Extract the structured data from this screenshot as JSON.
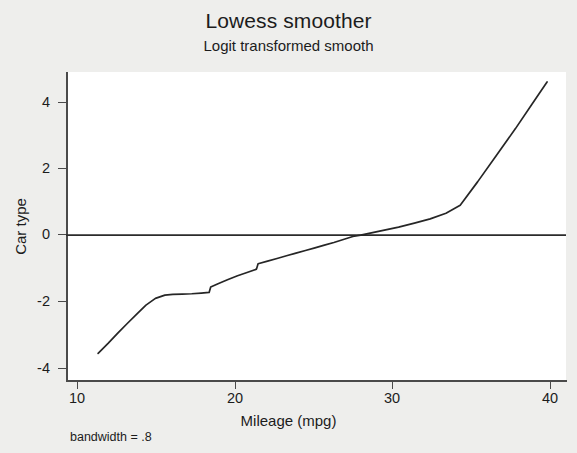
{
  "chart_data": {
    "type": "line",
    "title": "Lowess smoother",
    "subtitle": "Logit transformed smooth",
    "xlabel": "Mileage (mpg)",
    "ylabel": "Car type",
    "note": "bandwidth = .8",
    "grid": false,
    "legend": "none",
    "xlim": [
      10.0,
      41.6
    ],
    "ylim": [
      -4.35,
      4.9
    ],
    "xticks": [
      10,
      20,
      30,
      40
    ],
    "xtick_labels": [
      "10",
      "20",
      "30",
      "40"
    ],
    "yticks": [
      -4,
      -2,
      0,
      2,
      4
    ],
    "ytick_labels": [
      "-4",
      "-2",
      "0",
      "2",
      "4"
    ],
    "reference_lines": [
      {
        "orientation": "horizontal",
        "value": 0,
        "color": "#2b2b2b"
      }
    ],
    "series": [
      {
        "name": "Logit transformed lowess smooth",
        "color": "#262626",
        "x": [
          11.97,
          12.6,
          13.2,
          13.8,
          14.4,
          15.0,
          15.6,
          16.2,
          16.7,
          17.3,
          17.9,
          18.5,
          19.0,
          19.1,
          19.6,
          20.2,
          20.8,
          21.4,
          22.0,
          22.1,
          22.7,
          23.3,
          23.9,
          24.5,
          25.1,
          25.7,
          26.3,
          26.9,
          27.5,
          28.1,
          28.6,
          29.2,
          29.8,
          30.4,
          31.0,
          32.0,
          33.0,
          34.0,
          34.9,
          36.0,
          37.2,
          38.4,
          39.4,
          40.4
        ],
        "y": [
          -3.55,
          -3.25,
          -2.95,
          -2.66,
          -2.38,
          -2.1,
          -1.9,
          -1.8,
          -1.78,
          -1.77,
          -1.76,
          -1.74,
          -1.72,
          -1.56,
          -1.45,
          -1.33,
          -1.22,
          -1.12,
          -1.02,
          -0.86,
          -0.78,
          -0.7,
          -0.62,
          -0.54,
          -0.46,
          -0.38,
          -0.3,
          -0.22,
          -0.13,
          -0.04,
          0.0,
          0.06,
          0.12,
          0.18,
          0.24,
          0.36,
          0.49,
          0.66,
          0.9,
          1.6,
          2.4,
          3.2,
          3.9,
          4.6
        ],
        "discontinuities": [
          {
            "x": 19.05,
            "from": -1.72,
            "to": -1.56
          },
          {
            "x": 22.05,
            "from": -1.02,
            "to": -0.86
          }
        ]
      }
    ]
  },
  "chart": {
    "title": "Lowess smoother",
    "subtitle": "Logit transformed smooth",
    "xlabel": "Mileage (mpg)",
    "ylabel": "Car type",
    "note": "bandwidth = .8",
    "xticks": [
      "10",
      "20",
      "30",
      "40"
    ],
    "yticks": [
      "4",
      "2",
      "0",
      "-2",
      "-4"
    ]
  }
}
